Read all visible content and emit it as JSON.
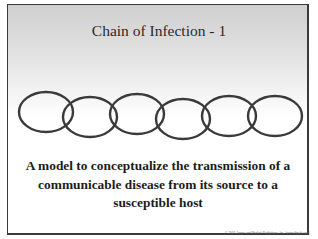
{
  "slide": {
    "title": "Chain of Infection - 1",
    "body_lines": [
      "A model to conceptualize the transmission of a",
      "communicable disease from its source to a",
      "susceptible host"
    ],
    "copyright": "© 2005 Jones and Bartlett Publishers, Inc. (www.jbpub.com)"
  },
  "chain": {
    "link_count": 6,
    "link_color": "#3a3a3a",
    "links": [
      {
        "cx": 46,
        "cy": 112,
        "rx": 27,
        "ry": 20
      },
      {
        "cx": 90,
        "cy": 117,
        "rx": 27,
        "ry": 20
      },
      {
        "cx": 137,
        "cy": 114,
        "rx": 27,
        "ry": 20
      },
      {
        "cx": 183,
        "cy": 119,
        "rx": 27,
        "ry": 20
      },
      {
        "cx": 229,
        "cy": 116,
        "rx": 27,
        "ry": 20
      },
      {
        "cx": 275,
        "cy": 116,
        "rx": 27,
        "ry": 20
      }
    ]
  },
  "colors": {
    "gradient_top": "#cfcfcf",
    "background": "#ffffff",
    "border": "#3a3a3a",
    "text": "#1c1c1c"
  }
}
